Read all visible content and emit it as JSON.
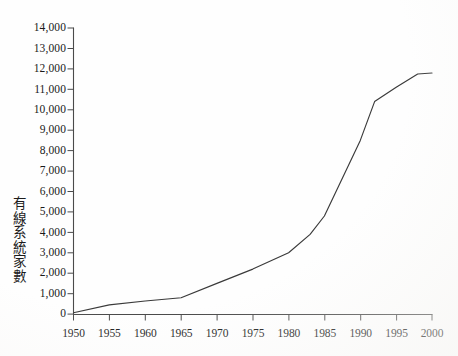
{
  "figure": {
    "title": "",
    "y_axis_title": "有線系統家數",
    "y_axis_title_chars": [
      "有",
      "線",
      "系",
      "統",
      "家",
      "數"
    ],
    "background_color": "#fefefe",
    "line_color": "#3a3a3a",
    "axis_color": "#4a4a4a",
    "text_color": "#1a1a1a"
  },
  "chart_data": {
    "type": "line",
    "title": "",
    "subtitle": "",
    "xlabel": "",
    "ylabel": "有線系統家數",
    "xlim": [
      1950,
      2000
    ],
    "ylim": [
      0,
      14000
    ],
    "grid": false,
    "legend": null,
    "legend_position": "none",
    "x_tick_labels": [
      "1950",
      "1955",
      "1960",
      "1965",
      "1970",
      "1975",
      "1980",
      "1985",
      "1990",
      "1995",
      "2000"
    ],
    "x_ticks": [
      1950,
      1955,
      1960,
      1965,
      1970,
      1975,
      1980,
      1985,
      1990,
      1995,
      2000
    ],
    "y_tick_labels": [
      "0",
      "1,000",
      "2,000",
      "3,000",
      "4,000",
      "5,000",
      "6,000",
      "7,000",
      "8,000",
      "9,000",
      "10,000",
      "11,000",
      "12,000",
      "13,000",
      "14,000"
    ],
    "y_ticks": [
      0,
      1000,
      2000,
      3000,
      4000,
      5000,
      6000,
      7000,
      8000,
      9000,
      10000,
      11000,
      12000,
      13000,
      14000
    ],
    "series": [
      {
        "name": "有線系統家數",
        "color": "#3a3a3a",
        "x": [
          1950,
          1955,
          1960,
          1965,
          1970,
          1975,
          1980,
          1983,
          1985,
          1990,
          1992,
          1995,
          1998,
          2000
        ],
        "values": [
          70,
          450,
          640,
          800,
          1500,
          2200,
          3000,
          3900,
          4800,
          8500,
          10400,
          11100,
          11750,
          11800
        ]
      }
    ]
  }
}
